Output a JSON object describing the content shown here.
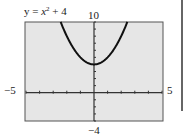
{
  "chart_data": {
    "type": "line",
    "equation": {
      "lhs": "y",
      "var": "x",
      "exp": "2",
      "rest": "+ 4"
    },
    "function": "x^2 + 4",
    "xlim": [
      -5,
      5
    ],
    "ylim": [
      -4,
      10
    ],
    "x_labels": {
      "min": "−5",
      "max": "5"
    },
    "y_labels": {
      "min": "−4",
      "max": "10"
    },
    "x_tick_step": 1,
    "y_tick_step": 1,
    "grid": false,
    "series": [
      {
        "name": "y = x^2 + 4",
        "x": [
          -2.45,
          -2,
          -1.5,
          -1,
          -0.5,
          0,
          0.5,
          1,
          1.5,
          2,
          2.45
        ],
        "values": [
          10,
          8,
          6.25,
          5,
          4.25,
          4,
          4.25,
          5,
          6.25,
          8,
          10
        ]
      }
    ],
    "colors": {
      "background": "#e6e6e6",
      "curve": "#111111",
      "frame": "#555555"
    }
  }
}
